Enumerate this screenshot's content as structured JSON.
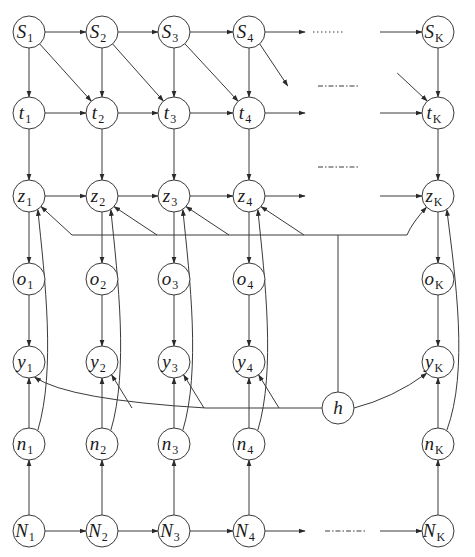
{
  "diagram": {
    "title": "",
    "node_radius": 16,
    "colors": {
      "stroke": "#3a3a3a",
      "text": "#1a1a1a",
      "background": "#ffffff"
    },
    "columns": [
      {
        "index": "1",
        "x": 29
      },
      {
        "index": "2",
        "x": 102
      },
      {
        "index": "3",
        "x": 174
      },
      {
        "index": "4",
        "x": 249
      },
      {
        "index": "K",
        "x": 438
      }
    ],
    "rows": [
      {
        "symbol": "S",
        "y": 32
      },
      {
        "symbol": "t",
        "y": 113
      },
      {
        "symbol": "z",
        "y": 196
      },
      {
        "symbol": "o",
        "y": 279
      },
      {
        "symbol": "y",
        "y": 362
      },
      {
        "symbol": "n",
        "y": 444
      },
      {
        "symbol": "N",
        "y": 531
      }
    ],
    "extra_nodes": [
      {
        "id": "h",
        "symbol": "h",
        "sub": "",
        "x": 338,
        "y": 408
      }
    ],
    "ellipsis_marks": [
      {
        "row": "S",
        "x1": 313,
        "x2": 344,
        "y": 32,
        "style": "dotted"
      },
      {
        "row": "S-t diagonal",
        "x1": 318,
        "x2": 358,
        "y": 86,
        "style": "dashdot"
      },
      {
        "row": "t-z gap",
        "x1": 318,
        "x2": 358,
        "y": 167,
        "style": "dashdot"
      },
      {
        "row": "N",
        "x1": 325,
        "x2": 366,
        "y": 531,
        "style": "dashdot"
      }
    ],
    "edges_description": [
      "S_i -> S_{i+1} (horizontal chain)",
      "S_i -> t_i (vertical)",
      "S_i -> t_{i+1} (diagonal)",
      "t_i -> t_{i+1} (horizontal chain)",
      "t_i -> z_i (vertical)",
      "z_i -> z_{i+1} (horizontal chain)",
      "z_i -> o_i -> y_i (vertical)",
      "N_i -> N_{i+1} (horizontal chain)",
      "N_i -> n_i -> y_i (vertical)",
      "n_i -> z_i (curved)",
      "h -> z_i (via shared bus)",
      "h -> y_i (via shared curve)"
    ]
  }
}
